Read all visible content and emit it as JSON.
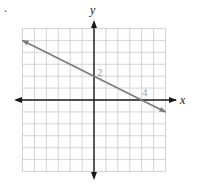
{
  "figure_marker": ".",
  "chart_data": {
    "type": "line",
    "title": "",
    "xlabel": "x",
    "ylabel": "y",
    "xlim": [
      -6,
      6
    ],
    "ylim": [
      -6,
      6
    ],
    "grid": true,
    "grid_step": 1,
    "series": [
      {
        "name": "y = -1/2 x + 2",
        "x": [
          -6,
          6
        ],
        "y": [
          5,
          -1
        ],
        "arrows": "both"
      }
    ],
    "annotations": [
      {
        "text": "2",
        "x": 0,
        "y": 2,
        "meaning": "y-intercept"
      },
      {
        "text": "4",
        "x": 4,
        "y": 0,
        "meaning": "x-intercept"
      }
    ]
  }
}
